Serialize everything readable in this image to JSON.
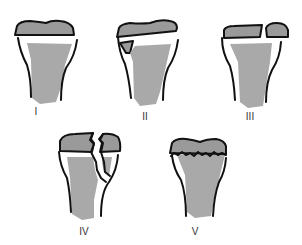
{
  "diagram": {
    "type": "Salter-Harris physeal fracture classification",
    "colors": {
      "stroke": "#111111",
      "epiphysis_fill": "#9a9a9a",
      "metaphysis_fill": "#a8a8a8",
      "background": "#ffffff"
    },
    "panels": [
      {
        "id": "I",
        "label": "I",
        "description": "Fracture through the physis (epiphysis separated)"
      },
      {
        "id": "II",
        "label": "II",
        "description": "Through physis with metaphyseal fragment"
      },
      {
        "id": "III",
        "label": "III",
        "description": "Through physis and epiphysis"
      },
      {
        "id": "IV",
        "label": "IV",
        "description": "Through metaphysis, physis and epiphysis"
      },
      {
        "id": "V",
        "label": "V",
        "description": "Crush injury of the physis"
      }
    ]
  }
}
